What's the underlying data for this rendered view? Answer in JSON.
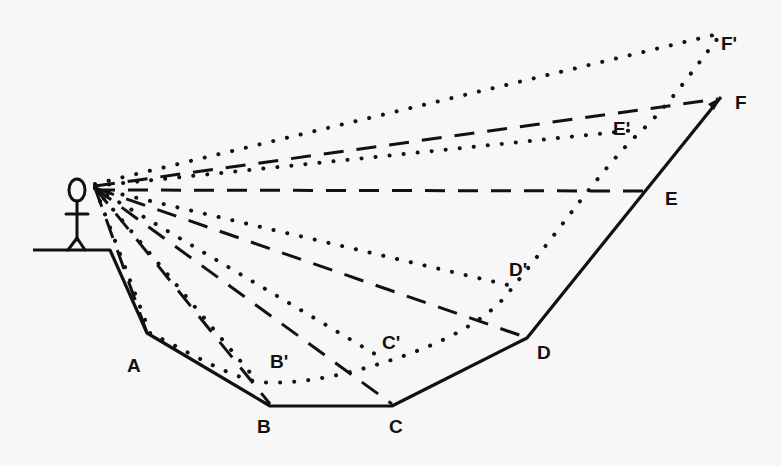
{
  "diagram": {
    "colors": {
      "ink": "#111111",
      "background": "#f7f7f7"
    },
    "observer": {
      "label": "observer-stick-figure",
      "eye": [
        95,
        188
      ]
    },
    "terrain_points": {
      "A": {
        "label": "A",
        "pos": [
          147,
          333
        ],
        "label_pos": [
          127,
          372
        ]
      },
      "B": {
        "label": "B",
        "pos": [
          270,
          406
        ],
        "label_pos": [
          257,
          433
        ]
      },
      "C": {
        "label": "C",
        "pos": [
          392,
          406
        ],
        "label_pos": [
          389,
          433
        ]
      },
      "D": {
        "label": "D",
        "pos": [
          527,
          338
        ],
        "label_pos": [
          537,
          359
        ]
      },
      "E": {
        "label": "E",
        "pos": [
          645,
          191
        ],
        "label_pos": [
          665,
          205
        ]
      },
      "F": {
        "label": "F",
        "pos": [
          721,
          97
        ],
        "label_pos": [
          735,
          109
        ]
      }
    },
    "apparent_points": {
      "B'": {
        "label": "B'",
        "pos": [
          268,
          383
        ],
        "label_pos": [
          270,
          368
        ]
      },
      "C'": {
        "label": "C'",
        "pos": [
          385,
          360
        ],
        "label_pos": [
          382,
          349
        ]
      },
      "D'": {
        "label": "D'",
        "pos": [
          512,
          288
        ],
        "label_pos": [
          509,
          276
        ]
      },
      "E'": {
        "label": "E'",
        "pos": [
          640,
          130
        ],
        "label_pos": [
          613,
          135
        ]
      },
      "F'": {
        "label": "F'",
        "pos": [
          722,
          33
        ],
        "label_pos": [
          721,
          50
        ]
      }
    },
    "legend": {
      "solid": "actual terrain profile",
      "dashed": "sight lines to actual points",
      "dotted": "sight lines to apparent points / apparent profile"
    }
  }
}
